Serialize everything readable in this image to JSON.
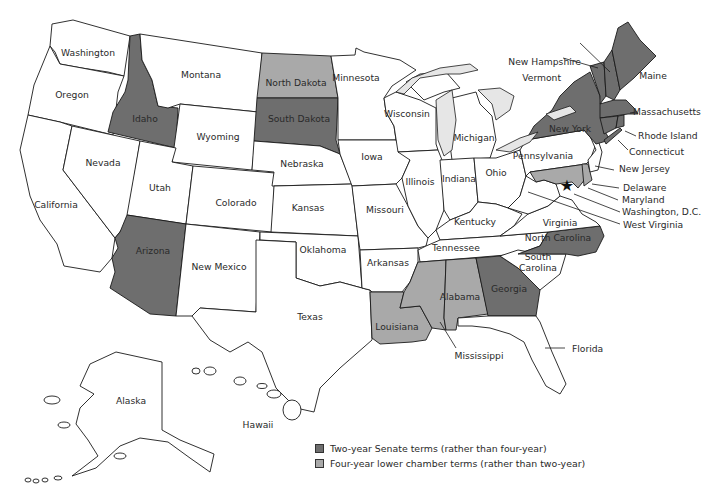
{
  "colors": {
    "two_year_senate": "#6e6e6e",
    "four_year_lower": "#a9a9a9",
    "none": "#ffffff",
    "lakes": "#e6e6e6",
    "border": "#1a1a1a"
  },
  "legend": {
    "items": [
      {
        "label": "Two-year Senate terms (rather than four-year)",
        "color": "#6e6e6e"
      },
      {
        "label": "Four-year lower chamber terms (rather than two-year)",
        "color": "#a9a9a9"
      }
    ]
  },
  "states": {
    "washington": {
      "label": "Washington",
      "category": "none"
    },
    "oregon": {
      "label": "Oregon",
      "category": "none"
    },
    "california": {
      "label": "California",
      "category": "none"
    },
    "nevada": {
      "label": "Nevada",
      "category": "none"
    },
    "idaho": {
      "label": "Idaho",
      "category": "two_year_senate"
    },
    "montana": {
      "label": "Montana",
      "category": "none"
    },
    "wyoming": {
      "label": "Wyoming",
      "category": "none"
    },
    "utah": {
      "label": "Utah",
      "category": "none"
    },
    "arizona": {
      "label": "Arizona",
      "category": "two_year_senate"
    },
    "colorado": {
      "label": "Colorado",
      "category": "none"
    },
    "new_mexico": {
      "label": "New Mexico",
      "category": "none"
    },
    "north_dakota": {
      "label": "North Dakota",
      "category": "four_year_lower"
    },
    "south_dakota": {
      "label": "South Dakota",
      "category": "two_year_senate"
    },
    "nebraska": {
      "label": "Nebraska",
      "category": "none"
    },
    "kansas": {
      "label": "Kansas",
      "category": "none"
    },
    "oklahoma": {
      "label": "Oklahoma",
      "category": "none"
    },
    "texas": {
      "label": "Texas",
      "category": "none"
    },
    "minnesota": {
      "label": "Minnesota",
      "category": "none"
    },
    "iowa": {
      "label": "Iowa",
      "category": "none"
    },
    "missouri": {
      "label": "Missouri",
      "category": "none"
    },
    "arkansas": {
      "label": "Arkansas",
      "category": "none"
    },
    "louisiana": {
      "label": "Louisiana",
      "category": "four_year_lower"
    },
    "wisconsin": {
      "label": "Wisconsin",
      "category": "none"
    },
    "illinois": {
      "label": "Illinois",
      "category": "none"
    },
    "michigan": {
      "label": "Michigan",
      "category": "none"
    },
    "indiana": {
      "label": "Indiana",
      "category": "none"
    },
    "ohio": {
      "label": "Ohio",
      "category": "none"
    },
    "kentucky": {
      "label": "Kentucky",
      "category": "none"
    },
    "tennessee": {
      "label": "Tennessee",
      "category": "none"
    },
    "mississippi": {
      "label": "Mississippi",
      "category": "four_year_lower"
    },
    "alabama": {
      "label": "Alabama",
      "category": "four_year_lower"
    },
    "georgia": {
      "label": "Georgia",
      "category": "two_year_senate"
    },
    "florida": {
      "label": "Florida",
      "category": "none"
    },
    "south_carolina": {
      "label": "South\nCarolina",
      "label_line1": "South",
      "label_line2": "Carolina",
      "category": "none"
    },
    "north_carolina": {
      "label": "North Carolina",
      "category": "two_year_senate"
    },
    "virginia": {
      "label": "Virginia",
      "category": "none"
    },
    "west_virginia": {
      "label": "West Virginia",
      "category": "none"
    },
    "pennsylvania": {
      "label": "Pennsylvania",
      "category": "none"
    },
    "new_york": {
      "label": "New York",
      "category": "two_year_senate"
    },
    "vermont": {
      "label": "Vermont",
      "category": "two_year_senate"
    },
    "new_hampshire": {
      "label": "New Hampshire",
      "category": "two_year_senate"
    },
    "maine": {
      "label": "Maine",
      "category": "two_year_senate"
    },
    "massachusetts": {
      "label": "Massachusetts",
      "category": "two_year_senate"
    },
    "rhode_island": {
      "label": "Rhode Island",
      "category": "two_year_senate"
    },
    "connecticut": {
      "label": "Connecticut",
      "category": "two_year_senate"
    },
    "new_jersey": {
      "label": "New Jersey",
      "category": "none"
    },
    "delaware": {
      "label": "Delaware",
      "category": "four_year_lower"
    },
    "maryland": {
      "label": "Maryland",
      "category": "four_year_lower"
    },
    "washington_dc": {
      "label": "Washington, D.C.",
      "category": "none"
    },
    "alaska": {
      "label": "Alaska",
      "category": "none"
    },
    "hawaii": {
      "label": "Hawaii",
      "category": "none"
    }
  }
}
